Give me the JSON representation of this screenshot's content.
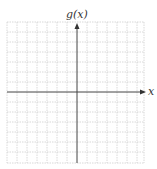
{
  "diagram": {
    "type": "coordinate-grid",
    "y_axis_label": "g(x)",
    "x_axis_label": "x",
    "grid": {
      "columns": 14,
      "rows": 14
    },
    "colors": {
      "grid": "#c8c8c8",
      "axis": "#444444",
      "background": "#ffffff"
    }
  }
}
